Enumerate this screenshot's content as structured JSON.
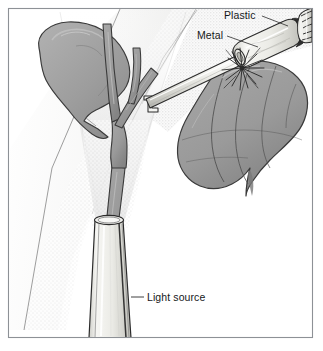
{
  "figure": {
    "style": "grayscale line drawing with stipple shading",
    "frame": {
      "border_color": "#8d9196",
      "background_color": "#ffffff",
      "x": 8,
      "y": 8,
      "width": 305,
      "height": 330
    }
  },
  "colors": {
    "outline": "#2b2b2b",
    "organ_fill": "#9b9b9b",
    "organ_fill_light": "#b4b4b4",
    "organ_shadow": "#7e7e7e",
    "instrument_fill": "#f2f2ef",
    "instrument_shadow": "#c9c9c4",
    "light_cone": "#e8e8e8",
    "tissue_plane": "#dededc",
    "label_text": "#15181a",
    "leader_line": "#2b2b2b",
    "frame_border": "#8d9196"
  },
  "labels": [
    {
      "id": "plastic",
      "text": "Plastic",
      "x": 224,
      "y": 19,
      "anchor": "start",
      "leader": {
        "x1": 262,
        "y1": 16,
        "x2": 288,
        "y2": 26
      },
      "points_to": "plastic-sheath"
    },
    {
      "id": "metal",
      "text": "Metal",
      "x": 197,
      "y": 39,
      "anchor": "start",
      "leader": {
        "x1": 227,
        "y1": 36,
        "x2": 258,
        "y2": 47
      },
      "points_to": "metal-shaft"
    },
    {
      "id": "light-source",
      "text": "Light source",
      "x": 147,
      "y": 301,
      "anchor": "start",
      "leader": {
        "x1": 131,
        "y1": 297,
        "x2": 144,
        "y2": 297
      },
      "points_to": "light-source-tube"
    }
  ],
  "anatomy": [
    {
      "id": "gallbladder",
      "name": "gallbladder",
      "description": "pear-shaped organ, upper left quadrant"
    },
    {
      "id": "biliary-tree",
      "name": "bile-duct-branches",
      "description": "Y-shaped branching duct running down the center"
    },
    {
      "id": "liver-lobe",
      "name": "liver-lobe",
      "description": "large lobulated organ at right being cauterized"
    },
    {
      "id": "tissue-plane",
      "name": "tissue-plane",
      "description": "stippled diagonal peritoneal surface behind instrument"
    }
  ],
  "instruments": [
    {
      "id": "cautery-probe",
      "name": "electrocautery-probe",
      "parts": [
        "plastic-sheath",
        "metal-shaft",
        "hook-tip"
      ],
      "description": "angled probe entering from upper right with spark at contact point"
    },
    {
      "id": "light-source-tube",
      "name": "light-source-tube",
      "description": "vertical illuminating cannula rising from bottom edge emitting a cone of light"
    }
  ],
  "effects": [
    {
      "id": "spark",
      "name": "cautery-spark",
      "x": 245,
      "y": 70,
      "description": "radiating burst at electrode tissue contact"
    },
    {
      "id": "light-cone",
      "name": "light-beam-cone",
      "description": "pale fan of light widening upward from the tube tip"
    }
  ]
}
